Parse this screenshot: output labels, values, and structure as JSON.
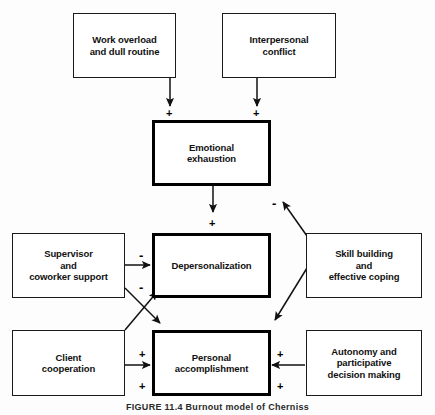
{
  "figure": {
    "caption": "FIGURE 11.4 Burnout model of Cherniss"
  },
  "nodes": {
    "work_overload": {
      "label_line1": "Work overload",
      "label_line2": "and dull routine",
      "emphasis": "thin"
    },
    "interpersonal_conflict": {
      "label_line1": "Interpersonal",
      "label_line2": "conflict",
      "emphasis": "thin"
    },
    "emotional_exhaustion": {
      "label_line1": "Emotional",
      "label_line2": "exhaustion",
      "emphasis": "thick"
    },
    "supervisor_support": {
      "label_line1": "Supervisor",
      "label_line2": "and",
      "label_line3": "coworker support",
      "emphasis": "thin"
    },
    "depersonalization": {
      "label_line1": "Depersonalization",
      "emphasis": "thick"
    },
    "skill_building": {
      "label_line1": "Skill building",
      "label_line2": "and",
      "label_line3": "effective coping",
      "emphasis": "thin"
    },
    "client_cooperation": {
      "label_line1": "Client",
      "label_line2": "cooperation",
      "emphasis": "thin"
    },
    "personal_accomplishment": {
      "label_line1": "Personal",
      "label_line2": "accomplishment",
      "emphasis": "thick"
    },
    "autonomy": {
      "label_line1": "Autonomy and",
      "label_line2": "participative",
      "label_line3": "decision making",
      "emphasis": "thin"
    }
  },
  "signs": {
    "workload_to_exhaustion": "+",
    "conflict_to_exhaustion": "+",
    "skill_to_exhaustion": "-",
    "exhaustion_to_depersonalization": "+",
    "support_to_depersonalization": "-",
    "client_to_depersonalization": "-",
    "support_to_accomplishment": "+",
    "client_to_accomplishment": "+",
    "skill_to_accomplishment": "+",
    "autonomy_to_accomplishment": "+"
  },
  "colors": {
    "stroke": "#111111",
    "background": "#ffffff"
  }
}
